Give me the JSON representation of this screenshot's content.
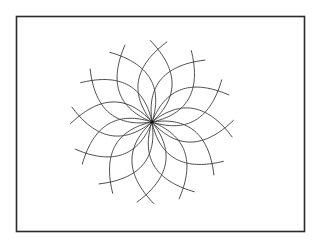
{
  "figure": {
    "frame": {
      "x": 16.5,
      "y": 16.5,
      "width": 288,
      "height": 215,
      "stroke": "#2b2b2b"
    },
    "rosette": {
      "center": {
        "x": 152,
        "y": 122
      },
      "petal_count": 12,
      "petal_length": 73,
      "petal_half_width": 17,
      "start_angle_deg": 4.7,
      "overshoot_t": 1.11,
      "line_color": "#3a3a3a",
      "center_dot_radius": 1.6
    }
  }
}
